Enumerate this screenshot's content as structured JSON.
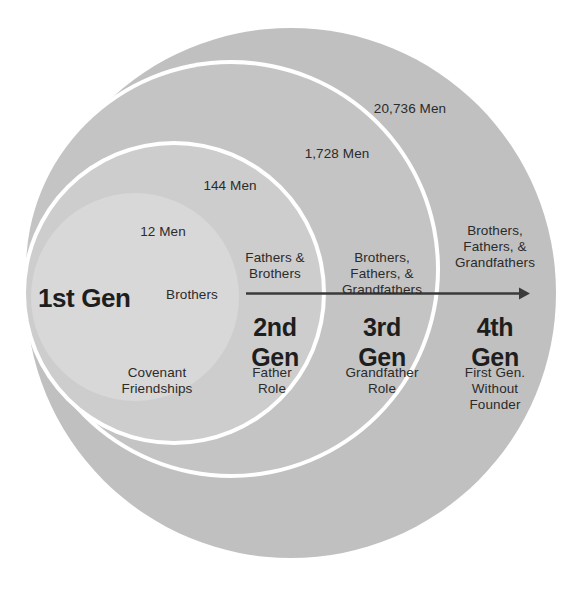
{
  "diagram": {
    "colors": {
      "background": "#ffffff",
      "gen1_fill": "#d4d4d4",
      "gen2_fill": "#c6c6c6",
      "gen3_fill": "#c2c2c2",
      "gen4_fill": "#c0c0c0",
      "ring_gap": "#ffffff",
      "text": "#2b2b2b",
      "title_text": "#1e1e1e",
      "arrow": "#3a3a3a"
    },
    "arrow": {
      "name": "progression-arrow",
      "description": "left-to-right arrow spanning 2nd through 4th generation"
    },
    "generations": [
      {
        "id": "gen1",
        "title": "1st Gen",
        "count": "12 Men",
        "relationship": "Brothers",
        "role": "Covenant\nFriendships"
      },
      {
        "id": "gen2",
        "title": "2nd\nGen",
        "count": "144 Men",
        "relationship": "Fathers &\nBrothers",
        "role": "Father\nRole"
      },
      {
        "id": "gen3",
        "title": "3rd\nGen",
        "count": "1,728 Men",
        "relationship": "Brothers,\nFathers, &\nGrandfathers",
        "role": "Grandfather\nRole"
      },
      {
        "id": "gen4",
        "title": "4th\nGen",
        "count": "20,736 Men",
        "relationship": "Brothers,\nFathers, &\nGrandfathers",
        "role": "First Gen.\nWithout\nFounder"
      }
    ]
  }
}
